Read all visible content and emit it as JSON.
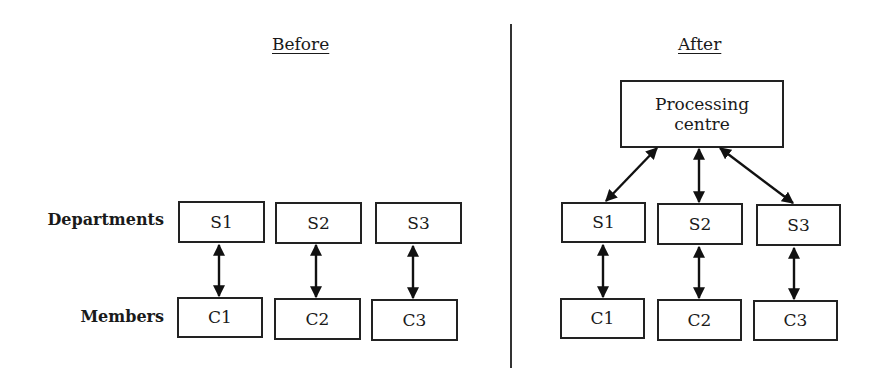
{
  "panels": {
    "before": {
      "title": "Before",
      "row_labels": {
        "departments": "Departments",
        "members": "Members"
      },
      "departments": [
        "S1",
        "S2",
        "S3"
      ],
      "members": [
        "C1",
        "C2",
        "C3"
      ]
    },
    "after": {
      "title": "After",
      "processing_centre": "Processing centre",
      "departments": [
        "S1",
        "S2",
        "S3"
      ],
      "members": [
        "C1",
        "C2",
        "C3"
      ]
    }
  }
}
